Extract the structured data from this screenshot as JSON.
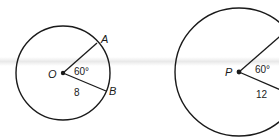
{
  "figures": [
    {
      "center_label": "O",
      "angle_label": "60°",
      "radius_label": "8",
      "point_labels": [
        "A",
        "B"
      ],
      "circle": {
        "cx": 63,
        "cy": 73,
        "r": 47
      }
    },
    {
      "center_label": "P",
      "angle_label": "60°",
      "radius_label": "12",
      "circle": {
        "cx": 239,
        "cy": 72,
        "r": 64
      }
    }
  ],
  "colors": {
    "stroke": "#1a1a1a",
    "background": "#ffffff"
  }
}
